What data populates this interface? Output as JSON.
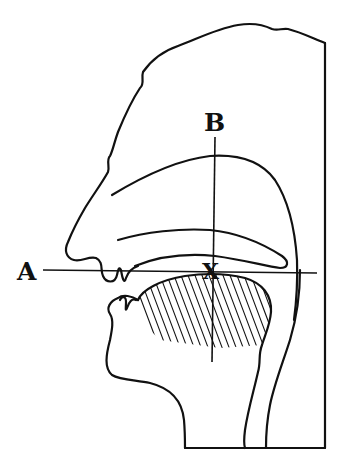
{
  "figure": {
    "labels": {
      "a": "A",
      "b": "B",
      "x": "X"
    },
    "colors": {
      "ink": "#111111",
      "background": "#ffffff"
    }
  }
}
